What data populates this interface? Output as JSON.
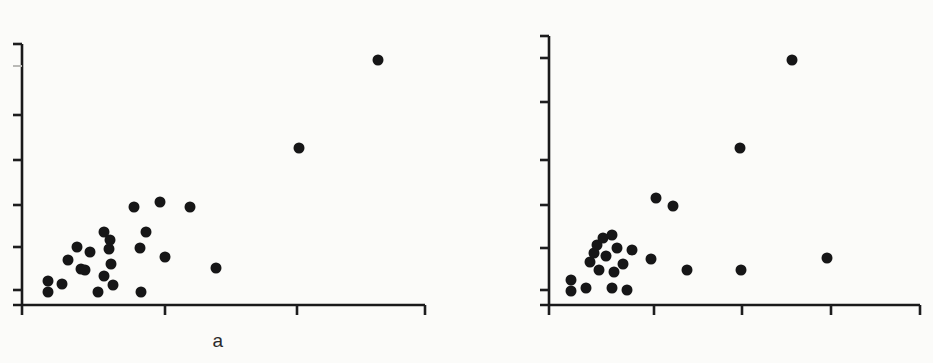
{
  "figure": {
    "background_color": "#fbfbf9",
    "ink_color": "#161617",
    "width": 933,
    "height": 363
  },
  "panels": [
    {
      "id": "a",
      "label": "a"
    },
    {
      "id": "b",
      "label": "b"
    }
  ],
  "chart_data": [
    {
      "type": "scatter",
      "title": "",
      "subtitle": "",
      "xlabel": "a",
      "ylabel": "",
      "panel_label": "a",
      "grid": false,
      "legend": null,
      "marker": {
        "shape": "circle",
        "color": "#161617",
        "size_px": 11,
        "filled": true
      },
      "axes": {
        "x_axis_pixel_y": 305,
        "y_axis_pixel_x": 22,
        "x_tick_pixels": [
          22,
          165,
          297,
          425
        ],
        "y_tick_pixels": [
          66,
          115,
          160,
          205,
          247,
          290
        ],
        "x_tick_labels": [
          "",
          "",
          "",
          ""
        ],
        "y_tick_labels": [
          "",
          "",
          "",
          "",
          "",
          ""
        ],
        "x_ticks_unlabeled": true,
        "y_ticks_unlabeled": true,
        "tick_direction": "outward",
        "top_y_tick_faint": true
      },
      "n_points": 23,
      "points_pixel": [
        [
          48,
          281
        ],
        [
          48,
          292
        ],
        [
          62,
          284
        ],
        [
          68,
          260
        ],
        [
          77,
          247
        ],
        [
          81,
          269
        ],
        [
          85,
          270
        ],
        [
          90,
          252
        ],
        [
          98,
          292
        ],
        [
          104,
          276
        ],
        [
          104,
          232
        ],
        [
          109,
          249
        ],
        [
          110,
          240
        ],
        [
          111,
          264
        ],
        [
          113,
          285
        ],
        [
          134,
          207
        ],
        [
          140,
          248
        ],
        [
          141,
          292
        ],
        [
          146,
          232
        ],
        [
          160,
          202
        ],
        [
          165,
          257
        ],
        [
          190,
          207
        ],
        [
          216,
          268
        ],
        [
          299,
          148
        ],
        [
          378,
          60
        ]
      ]
    },
    {
      "type": "scatter",
      "title": "",
      "subtitle": "",
      "xlabel": "b",
      "ylabel": "",
      "panel_label": "b",
      "grid": false,
      "legend": null,
      "marker": {
        "shape": "circle",
        "color": "#161617",
        "size_px": 11,
        "filled": true
      },
      "axes": {
        "x_axis_pixel_y": 305,
        "y_axis_pixel_x": 83,
        "x_tick_pixels": [
          83,
          188,
          276,
          365,
          454
        ],
        "y_tick_pixels": [
          58,
          102,
          160,
          205,
          248,
          290
        ],
        "x_tick_labels": [
          "",
          "",
          "",
          "",
          ""
        ],
        "y_tick_labels": [
          "",
          "",
          "",
          "",
          "",
          ""
        ],
        "x_ticks_unlabeled": true,
        "y_ticks_unlabeled": true,
        "tick_direction": "outward"
      },
      "n_points": 23,
      "points_pixel": [
        [
          105,
          280
        ],
        [
          105,
          291
        ],
        [
          120,
          288
        ],
        [
          124,
          262
        ],
        [
          128,
          253
        ],
        [
          131,
          245
        ],
        [
          133,
          270
        ],
        [
          137,
          238
        ],
        [
          140,
          256
        ],
        [
          146,
          288
        ],
        [
          146,
          235
        ],
        [
          148,
          272
        ],
        [
          151,
          248
        ],
        [
          157,
          264
        ],
        [
          161,
          290
        ],
        [
          166,
          250
        ],
        [
          185,
          259
        ],
        [
          190,
          198
        ],
        [
          207,
          206
        ],
        [
          221,
          270
        ],
        [
          275,
          270
        ],
        [
          361,
          258
        ],
        [
          274,
          148
        ],
        [
          326,
          60
        ]
      ]
    }
  ]
}
